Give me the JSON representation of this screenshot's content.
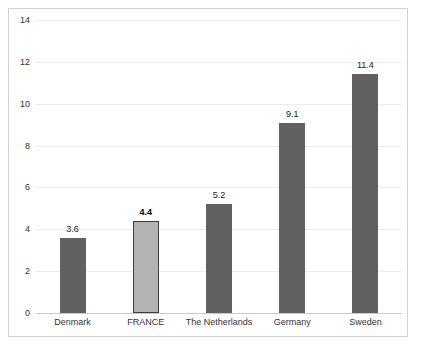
{
  "chart_data": {
    "type": "bar",
    "title": "",
    "subtitle": "",
    "xlabel": "",
    "ylabel": "",
    "categories": [
      "Denmark",
      "FRANCE",
      "The Netherlands",
      "Germany",
      "Sweden"
    ],
    "values": [
      3.6,
      4.4,
      5.2,
      9.1,
      11.4
    ],
    "value_labels": [
      "3.6",
      "4.4",
      "5.2",
      "9.1",
      "11.4"
    ],
    "highlight_index": 1,
    "highlight_category": "FRANCE",
    "ylim": [
      0,
      14
    ],
    "yticks": [
      0,
      2,
      4,
      6,
      8,
      10,
      12,
      14
    ],
    "ytick_labels": [
      "0",
      "2",
      "4",
      "6",
      "8",
      "10",
      "12",
      "14"
    ],
    "grid": true,
    "grid_axis": "y",
    "legend": false,
    "legend_position": "none",
    "colors": {
      "bar_default": "#616161",
      "bar_highlight": "#b3b3b3",
      "bar_highlight_border": "#3d3d3d",
      "gridline": "#ececec",
      "baseline": "#c9c9c9",
      "frame": "#d2d2d2",
      "background": "#ffffff",
      "tick_text": "#333333",
      "value_text": "#222222"
    }
  }
}
